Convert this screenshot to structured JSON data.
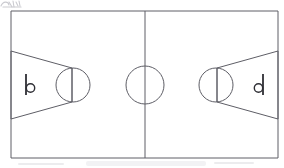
{
  "figure": {
    "style": "pencil line drawing on white paper",
    "background_color": "#ffffff",
    "line_color": "#5e5e66",
    "mark_color": "#2f2f35",
    "artifact_color": "#b9b9c0"
  },
  "court": {
    "outline_label": "court-boundary",
    "bounds": {
      "x": 11,
      "y": 11,
      "width": 267,
      "height": 147
    },
    "center_line": {
      "label": "half-court-line",
      "x": 145,
      "y1": 11,
      "y2": 158
    },
    "center_circle": {
      "label": "center-circle",
      "cx": 145,
      "cy": 85,
      "r": 19
    }
  },
  "left_half": {
    "label": "left-half-court",
    "key": {
      "label": "left-key-trapezoid",
      "points": "11,51 72,68 72,102 11,119",
      "baseline_top_y": 51,
      "baseline_bottom_y": 119,
      "free_throw_line_x": 72
    },
    "free_throw_line": {
      "label": "left-free-throw-line",
      "x": 72,
      "y1": 68,
      "y2": 102
    },
    "free_throw_circle": {
      "label": "left-free-throw-circle",
      "cx": 73,
      "cy": 85,
      "r": 17
    },
    "hoop_marker": {
      "label": "left-hoop-marker",
      "glyph": "b",
      "post_x": 26,
      "post_y1": 74,
      "post_y2": 95,
      "ring_cx": 30.5,
      "ring_cy": 88,
      "ring_r": 4.2
    }
  },
  "right_half": {
    "label": "right-half-court",
    "key": {
      "label": "right-key-trapezoid",
      "points": "278,51 217,68 217,102 278,119",
      "baseline_top_y": 51,
      "baseline_bottom_y": 119,
      "free_throw_line_x": 217
    },
    "free_throw_line": {
      "label": "right-free-throw-line",
      "x": 217,
      "y1": 68,
      "y2": 102
    },
    "free_throw_circle": {
      "label": "right-free-throw-circle",
      "cx": 216,
      "cy": 85,
      "r": 17
    },
    "hoop_marker": {
      "label": "right-hoop-marker",
      "glyph": "d",
      "post_x": 263,
      "post_y1": 74,
      "post_y2": 95,
      "ring_cx": 258.5,
      "ring_cy": 88,
      "ring_r": 4.2
    }
  },
  "artifacts": {
    "corner_scribble": {
      "label": "top-left-scan-scribble",
      "note": "faint cut-off handwriting at top-left edge"
    },
    "bottom_smudge": {
      "label": "bottom-scan-smudge",
      "note": "faint grey band below the court"
    }
  }
}
